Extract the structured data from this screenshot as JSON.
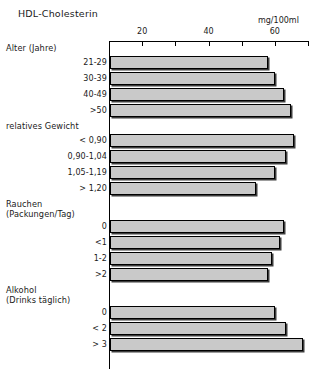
{
  "chart_data": {
    "type": "bar",
    "orientation": "horizontal",
    "title": "HDL-Cholesterin",
    "xlabel": "mg/100ml",
    "ylabel": "",
    "xlim": [
      10,
      70
    ],
    "xticks": [
      10,
      20,
      30,
      40,
      50,
      60,
      70
    ],
    "xtick_labels": [
      "",
      "20",
      "",
      "40",
      "",
      "60",
      ""
    ],
    "grid": false,
    "legend": "none",
    "bar_fill": "#c9c9c9",
    "bar_edge": "#000000",
    "groups": [
      {
        "name": "Alter (Jahre)",
        "heading": "Alter (Jahre)",
        "subheading": "",
        "categories": [
          "21-29",
          "30-39",
          "40-49",
          ">50"
        ],
        "values": [
          58.0,
          60.0,
          62.7,
          65.0
        ]
      },
      {
        "name": "relatives Gewicht",
        "heading": "relatives Gewicht",
        "subheading": "",
        "categories": [
          "< 0,90",
          "0,90-1,04",
          "1,05-1,19",
          "> 1,20"
        ],
        "values": [
          65.8,
          63.3,
          60.0,
          54.2
        ]
      },
      {
        "name": "Rauchen (Packungen/Tag)",
        "heading": "Rauchen",
        "subheading": "(Packungen/Tag)",
        "categories": [
          "0",
          "<1",
          "1-2",
          ">2"
        ],
        "values": [
          62.7,
          61.5,
          59.1,
          57.9
        ]
      },
      {
        "name": "Alkohol (Drinks täglich)",
        "heading": "Alkohol",
        "subheading": "(Drinks täglich)",
        "categories": [
          "0",
          "< 2",
          "> 3"
        ],
        "values": [
          60.0,
          63.3,
          68.5
        ]
      }
    ]
  },
  "chart": {
    "title": "HDL-Cholesterin",
    "unit_label": "mg/100ml"
  }
}
